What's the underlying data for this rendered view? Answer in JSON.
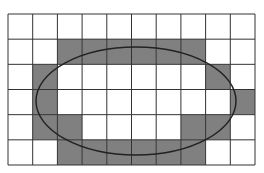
{
  "diagram": {
    "grid": {
      "cols": 10,
      "rows": 6,
      "x0": 8,
      "y0": 14,
      "x1": 255,
      "y1": 165,
      "line_color": "#333333",
      "fill_color": "#808080",
      "empty_color": "#ffffff",
      "filled_cells": [
        [
          1,
          2
        ],
        [
          1,
          3
        ],
        [
          1,
          4
        ],
        [
          1,
          5
        ],
        [
          1,
          6
        ],
        [
          1,
          7
        ],
        [
          2,
          1
        ],
        [
          2,
          8
        ],
        [
          3,
          1
        ],
        [
          3,
          9
        ],
        [
          4,
          1
        ],
        [
          4,
          2
        ],
        [
          4,
          7
        ],
        [
          4,
          8
        ],
        [
          5,
          2
        ],
        [
          5,
          3
        ],
        [
          5,
          4
        ],
        [
          5,
          5
        ],
        [
          5,
          6
        ],
        [
          5,
          7
        ]
      ]
    },
    "ellipse": {
      "cx": 136,
      "cy": 101,
      "rx": 100,
      "ry": 54,
      "stroke": "#222222",
      "stroke_width": 1.5
    }
  }
}
